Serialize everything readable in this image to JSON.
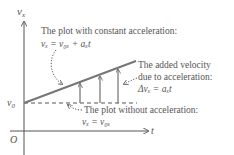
{
  "diagram": {
    "axes": {
      "y_label": "v",
      "y_label_sub": "x",
      "x_label": "t",
      "origin_label": "O",
      "v0_label": "v",
      "v0_label_sub": "0"
    },
    "annotations": {
      "accel_plot": {
        "line1": "The plot with constant acceleration:",
        "formula": "vₓ = v₀ₓ + aₓt"
      },
      "added_velocity": {
        "line1": "The added velocity",
        "line2": "due to acceleration:",
        "formula": "Δvₓ = aₓt"
      },
      "no_accel_plot": {
        "line1": "The plot without acceleration:",
        "formula": "vₓ = v₀ₓ"
      }
    },
    "colors": {
      "axis": "#555555",
      "sloped_line": "#777777",
      "text": "#555555",
      "dashed": "#555555"
    }
  }
}
